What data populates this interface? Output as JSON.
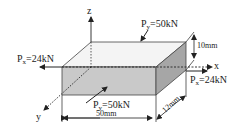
{
  "diagram": {
    "axes": {
      "x": "x",
      "y": "y",
      "z": "z"
    },
    "loads": {
      "px_left": {
        "main": "P",
        "sub": "x",
        "value": "=24kN"
      },
      "px_right": {
        "main": "P",
        "sub": "x",
        "value": "=24kN"
      },
      "py_top": {
        "main": "P",
        "sub": "y",
        "value": "=50kN"
      },
      "py_front": {
        "main": "P",
        "sub": "y",
        "value": "=50kN"
      }
    },
    "dimensions": {
      "length": "50mm",
      "height": "10mm",
      "depth": "12mm"
    },
    "colors": {
      "top_face": "#f2f2f2",
      "front_face": "#c8c8c8",
      "side_face": "#a8a8a8",
      "line": "#222222"
    }
  }
}
